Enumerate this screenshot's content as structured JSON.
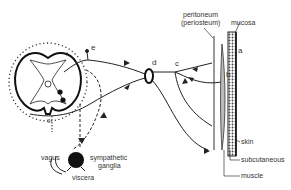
{
  "figure": {
    "structures": {
      "spinal_cord": "spinal cord cross-section",
      "sympathetic_ganglia": "sympathetic ganglia",
      "dorsal_root_ganglion": "d"
    },
    "labels": {
      "peritoneum": "peritoneum",
      "periosteum": "(periosteum)",
      "mucosa": "mucosa",
      "skin": "skin",
      "subcutaneous": "subcutaneous",
      "muscle": "muscle",
      "vagus": "vagus",
      "sympathetic": "sympathetic",
      "ganglia": "ganglia",
      "viscera": "viscera"
    },
    "letters": {
      "a": "a",
      "b": "b",
      "c": "c",
      "d": "d",
      "e": "e",
      "f": "f",
      "g": "g"
    },
    "colors": {
      "line": "#222222",
      "text": "#333333",
      "background": "#ffffff"
    }
  }
}
